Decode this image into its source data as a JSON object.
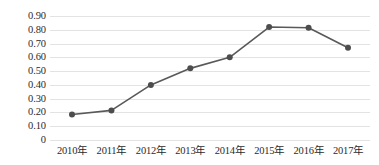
{
  "chart_data": {
    "type": "line",
    "title": "",
    "subtitle": "",
    "xlabel": "",
    "ylabel": "",
    "categories": [
      "2010年",
      "2011年",
      "2012年",
      "2013年",
      "2014年",
      "2015年",
      "2016年",
      "2017年"
    ],
    "values": [
      0.185,
      0.215,
      0.4,
      0.52,
      0.6,
      0.82,
      0.815,
      0.67
    ],
    "series": [
      {
        "name": "",
        "values": [
          0.185,
          0.215,
          0.4,
          0.52,
          0.6,
          0.82,
          0.815,
          0.67
        ]
      }
    ],
    "ylim": [
      0,
      0.9
    ],
    "ytick_values": [
      0,
      0.1,
      0.2,
      0.3,
      0.4,
      0.5,
      0.6,
      0.7,
      0.8,
      0.9
    ],
    "ytick_labels": [
      "0",
      "0.10",
      "0.20",
      "0.30",
      "0.40",
      "0.50",
      "0.60",
      "0.70",
      "0.80",
      "0.90"
    ],
    "xtick_labels": [
      "2010年",
      "2011年",
      "2012年",
      "2013年",
      "2014年",
      "2015年",
      "2016年",
      "2017年"
    ],
    "grid": true,
    "grid_axis": "y",
    "legend": false,
    "legend_position": "none",
    "annotations": [],
    "colors": {
      "line": "#595959",
      "marker": "#4d4d4d",
      "grid": "#e3e3e3",
      "text": "#2b2b2b",
      "background": "#ffffff"
    },
    "marker": "circle",
    "line_width": 1.6,
    "marker_size": 4
  }
}
